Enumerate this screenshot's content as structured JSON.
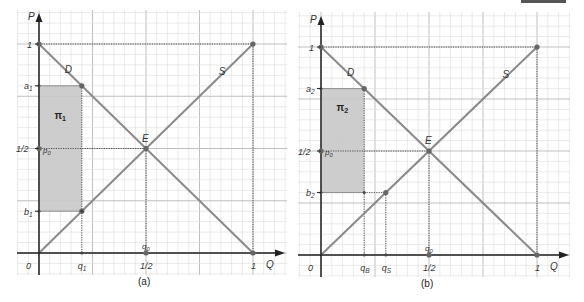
{
  "figure": {
    "top_bar_color": "#555555",
    "colors": {
      "grid_minor": "#dcdcdc",
      "grid_major": "#b8b8b8",
      "axis": "#222222",
      "curve": "#8a8a8a",
      "point": "#666666",
      "shade": "#c8c8c8",
      "dotted": "#555555"
    },
    "panels": [
      {
        "id": "a",
        "caption": "(a)",
        "origin": [
          39,
          253
        ],
        "unit_x": 214,
        "unit_y": 209,
        "grid": {
          "x0": 17,
          "x1": 287,
          "y0": 10,
          "y1": 275,
          "step": 10.7
        },
        "axis_labels": {
          "y": "P",
          "x": "Q"
        },
        "tick_labels": {
          "origin": "0",
          "x_half": "1/2",
          "x_one": "1",
          "y_one": "1",
          "y_half": "1/2"
        },
        "curve_labels": {
          "demand": "D",
          "supply": "S",
          "equilibrium": "E"
        },
        "p0_label": "p0",
        "q0_label": "q0",
        "profit_label": "π1",
        "upper_price": {
          "label": "a1",
          "value": 0.8
        },
        "lower_price": {
          "label": "b1",
          "value": 0.2
        },
        "quantities": [
          {
            "label": "q1",
            "value": 0.2
          }
        ]
      },
      {
        "id": "b",
        "caption": "(b)",
        "origin": [
          321,
          255
        ],
        "unit_x": 216,
        "unit_y": 208,
        "grid": {
          "x0": 298,
          "x1": 570,
          "y0": 12,
          "y1": 277,
          "step": 10.8
        },
        "axis_labels": {
          "y": "P",
          "x": "Q"
        },
        "tick_labels": {
          "origin": "0",
          "x_half": "1/2",
          "x_one": "1",
          "y_one": "1",
          "y_half": "1/2"
        },
        "curve_labels": {
          "demand": "D",
          "supply": "S",
          "equilibrium": "E"
        },
        "p0_label": "p0",
        "q0_label": "q0",
        "profit_label": "π2",
        "upper_price": {
          "label": "a2",
          "value": 0.8
        },
        "lower_price": {
          "label": "b2",
          "value": 0.3
        },
        "quantities": [
          {
            "label": "qB",
            "value": 0.2
          },
          {
            "label": "qS",
            "value": 0.3
          }
        ]
      }
    ]
  }
}
